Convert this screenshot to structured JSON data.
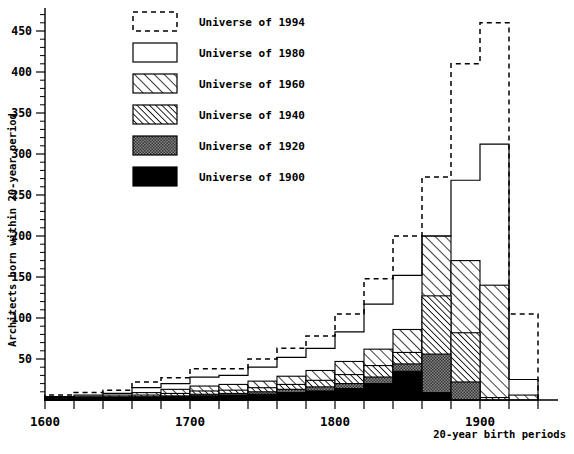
{
  "chart_data": {
    "type": "bar",
    "title": "",
    "xlabel": "20-year birth periods",
    "ylabel": "Architects born within 20-year period",
    "xlim": [
      1600,
      1940
    ],
    "ylim": [
      0,
      470
    ],
    "grid": false,
    "legend_position": "top-left",
    "bin_width": 20,
    "xticks": [
      1600,
      1700,
      1800,
      1900
    ],
    "xtick_labels": [
      "1600",
      "1700",
      "1800",
      "1900"
    ],
    "yticks": [
      50,
      100,
      150,
      200,
      250,
      300,
      350,
      400,
      450
    ],
    "ytick_labels": [
      "50",
      "100",
      "150",
      "200",
      "250",
      "300",
      "350",
      "400",
      "450"
    ],
    "minor_ytick_step": 10,
    "categories": [
      "1600-1620",
      "1620-1640",
      "1640-1660",
      "1660-1680",
      "1680-1700",
      "1700-1720",
      "1720-1740",
      "1740-1760",
      "1760-1780",
      "1780-1800",
      "1800-1820",
      "1820-1840",
      "1840-1860",
      "1860-1880",
      "1880-1900",
      "1900-1920",
      "1920-1940"
    ],
    "series": [
      {
        "name": "Universe of 1994",
        "key": "u1994",
        "style": "dashed-outline",
        "values": [
          6,
          9,
          12,
          22,
          27,
          38,
          38,
          50,
          63,
          78,
          105,
          148,
          200,
          272,
          410,
          460,
          105
        ]
      },
      {
        "name": "Universe of 1980",
        "key": "u1980",
        "style": "solid-outline",
        "values": [
          4,
          6,
          8,
          15,
          20,
          28,
          30,
          40,
          52,
          63,
          83,
          117,
          152,
          200,
          268,
          312,
          25
        ]
      },
      {
        "name": "Universe of 1960",
        "key": "u1960",
        "style": "hatch-light",
        "values": [
          3,
          4,
          6,
          9,
          13,
          17,
          19,
          23,
          29,
          36,
          47,
          62,
          86,
          200,
          170,
          140,
          6
        ]
      },
      {
        "name": "Universe of 1940",
        "key": "u1940",
        "style": "hatch-dark",
        "values": [
          2,
          3,
          4,
          6,
          8,
          11,
          12,
          15,
          19,
          24,
          31,
          42,
          58,
          127,
          82,
          3,
          0
        ]
      },
      {
        "name": "Universe of 1920",
        "key": "u1920",
        "style": "stipple",
        "values": [
          1,
          2,
          3,
          4,
          5,
          7,
          8,
          10,
          13,
          16,
          20,
          28,
          44,
          56,
          22,
          0,
          0
        ]
      },
      {
        "name": "Universe of 1900",
        "key": "u1900",
        "style": "solid-black",
        "values": [
          1,
          1,
          2,
          3,
          4,
          5,
          6,
          7,
          9,
          11,
          14,
          20,
          35,
          9,
          0,
          0,
          0
        ]
      }
    ]
  },
  "legend": {
    "items": [
      {
        "label": "Universe of 1994",
        "style": "dashed-outline"
      },
      {
        "label": "Universe of 1980",
        "style": "solid-outline"
      },
      {
        "label": "Universe of 1960",
        "style": "hatch-light"
      },
      {
        "label": "Universe of 1940",
        "style": "hatch-dark"
      },
      {
        "label": "Universe of 1920",
        "style": "stipple"
      },
      {
        "label": "Universe of 1900",
        "style": "solid-black"
      }
    ]
  },
  "colors": {
    "ink": "#000000",
    "paper": "#ffffff",
    "stipple": "#606060"
  }
}
